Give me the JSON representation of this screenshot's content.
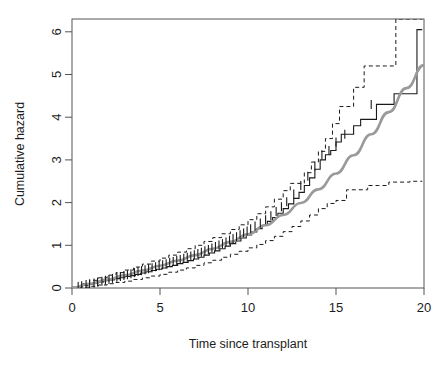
{
  "page": {
    "running_head": "DINATA: FOR THE RE-TRANSPLANT",
    "page_number": "9"
  },
  "figure": {
    "y_axis_title": "Cumulative hazard",
    "x_axis_title": "Time since transplant"
  },
  "chart_data": {
    "type": "line",
    "title": "",
    "xlabel": "Time since transplant",
    "ylabel": "Cumulative hazard",
    "xlim": [
      0,
      20
    ],
    "ylim": [
      0,
      6.3
    ],
    "xticks": [
      0,
      5,
      10,
      15,
      20
    ],
    "yticks": [
      0,
      1,
      2,
      3,
      4,
      5,
      6
    ],
    "grid": false,
    "legend": "none",
    "box": true,
    "annotations": [
      "Solid black step curve: Nelson-Aalen cumulative hazard estimate",
      "Dashed black step curves: pointwise confidence limits",
      "Smooth grey curve: fitted parametric cumulative hazard",
      "Short vertical ticks on the step curve mark censored observations"
    ],
    "series": [
      {
        "name": "Nelson-Aalen estimate",
        "style": "step",
        "color": "#1a1a1a",
        "dash": "solid",
        "width": 1.1,
        "x": [
          0.0,
          0.3,
          0.6,
          0.9,
          1.2,
          1.5,
          1.8,
          2.1,
          2.4,
          2.7,
          3.0,
          3.3,
          3.6,
          3.9,
          4.2,
          4.5,
          4.8,
          5.1,
          5.4,
          5.7,
          6.0,
          6.3,
          6.6,
          6.9,
          7.2,
          7.5,
          7.8,
          8.1,
          8.4,
          8.7,
          9.0,
          9.3,
          9.6,
          9.9,
          10.2,
          10.5,
          10.8,
          11.1,
          11.4,
          11.7,
          12.0,
          12.3,
          12.6,
          12.9,
          13.2,
          13.5,
          13.8,
          14.1,
          14.4,
          14.7,
          15.0,
          15.3,
          15.6,
          16.0,
          16.4,
          16.8,
          17.3,
          17.8,
          18.3,
          18.7,
          19.2,
          19.6,
          19.9
        ],
        "y": [
          0.0,
          0.03,
          0.06,
          0.09,
          0.12,
          0.14,
          0.17,
          0.19,
          0.22,
          0.24,
          0.27,
          0.29,
          0.32,
          0.35,
          0.38,
          0.41,
          0.44,
          0.47,
          0.5,
          0.53,
          0.57,
          0.6,
          0.64,
          0.68,
          0.72,
          0.77,
          0.82,
          0.87,
          0.92,
          0.98,
          1.04,
          1.1,
          1.17,
          1.24,
          1.31,
          1.39,
          1.47,
          1.56,
          1.65,
          1.75,
          1.86,
          1.97,
          2.1,
          2.24,
          2.4,
          2.58,
          2.78,
          3.0,
          3.12,
          3.22,
          3.42,
          3.6,
          3.6,
          3.8,
          3.95,
          3.95,
          4.3,
          4.3,
          4.55,
          4.55,
          4.55,
          6.05,
          6.05
        ]
      },
      {
        "name": "Upper confidence limit",
        "style": "step",
        "color": "#1a1a1a",
        "dash": "dashed",
        "width": 1.0,
        "x": [
          0.0,
          0.5,
          1.0,
          1.5,
          2.0,
          2.5,
          3.0,
          3.5,
          4.0,
          4.5,
          5.0,
          5.5,
          6.0,
          6.5,
          7.0,
          7.5,
          8.0,
          8.5,
          9.0,
          9.5,
          10.0,
          10.5,
          11.0,
          11.5,
          12.0,
          12.4,
          12.8,
          13.2,
          13.6,
          14.0,
          14.4,
          14.8,
          15.2,
          15.6,
          16.0,
          16.6,
          17.2,
          17.8,
          18.4,
          19.0,
          19.4,
          19.9
        ],
        "y": [
          0.02,
          0.1,
          0.18,
          0.24,
          0.3,
          0.36,
          0.42,
          0.49,
          0.56,
          0.63,
          0.7,
          0.77,
          0.84,
          0.92,
          1.0,
          1.09,
          1.18,
          1.27,
          1.37,
          1.48,
          1.6,
          1.74,
          1.9,
          2.08,
          2.28,
          2.45,
          2.45,
          2.7,
          2.95,
          3.2,
          3.5,
          3.85,
          4.25,
          4.25,
          4.7,
          5.2,
          5.2,
          5.2,
          6.3,
          6.3,
          6.3,
          6.3
        ]
      },
      {
        "name": "Lower confidence limit",
        "style": "step",
        "color": "#1a1a1a",
        "dash": "dashed",
        "width": 1.0,
        "x": [
          0.0,
          0.5,
          1.0,
          1.5,
          2.0,
          2.5,
          3.0,
          3.5,
          4.0,
          4.5,
          5.0,
          5.5,
          6.0,
          6.5,
          7.0,
          7.5,
          8.0,
          8.5,
          9.0,
          9.5,
          10.0,
          10.5,
          11.0,
          11.5,
          12.0,
          12.5,
          13.0,
          13.5,
          14.0,
          14.5,
          15.0,
          15.6,
          16.2,
          16.8,
          17.4,
          18.0,
          18.6,
          19.2,
          19.9
        ],
        "y": [
          0.0,
          0.02,
          0.04,
          0.07,
          0.1,
          0.13,
          0.16,
          0.2,
          0.24,
          0.28,
          0.32,
          0.37,
          0.42,
          0.47,
          0.53,
          0.59,
          0.65,
          0.72,
          0.79,
          0.86,
          0.94,
          1.02,
          1.11,
          1.21,
          1.32,
          1.44,
          1.57,
          1.71,
          1.86,
          1.98,
          2.05,
          2.3,
          2.3,
          2.4,
          2.4,
          2.48,
          2.48,
          2.5,
          2.5
        ]
      },
      {
        "name": "Fitted parametric hazard",
        "style": "smooth",
        "color": "#9a9a9a",
        "dash": "solid",
        "width": 2.6,
        "x": [
          0.0,
          1.0,
          2.0,
          3.0,
          4.0,
          5.0,
          6.0,
          7.0,
          8.0,
          9.0,
          10.0,
          11.0,
          12.0,
          13.0,
          14.0,
          15.0,
          16.0,
          17.0,
          18.0,
          19.0,
          20.0
        ],
        "y": [
          0.0,
          0.1,
          0.2,
          0.3,
          0.41,
          0.52,
          0.64,
          0.77,
          0.92,
          1.08,
          1.26,
          1.47,
          1.71,
          1.99,
          2.31,
          2.68,
          3.11,
          3.6,
          4.12,
          4.68,
          5.22
        ]
      }
    ],
    "censor_marks": {
      "name": "Censoring tick marks",
      "color": "#1a1a1a",
      "x": [
        0.35,
        0.55,
        0.8,
        1.0,
        1.25,
        1.45,
        1.7,
        1.9,
        2.1,
        2.3,
        2.55,
        2.75,
        2.95,
        3.15,
        3.35,
        3.55,
        3.75,
        3.95,
        4.15,
        4.35,
        4.55,
        4.75,
        4.95,
        5.15,
        5.35,
        5.55,
        5.75,
        5.95,
        6.15,
        6.35,
        6.55,
        6.75,
        6.95,
        7.15,
        7.35,
        7.55,
        7.75,
        7.95,
        8.15,
        8.35,
        8.55,
        8.75,
        8.95,
        9.15,
        9.35,
        9.55,
        9.75,
        9.95,
        10.15,
        10.4,
        10.7,
        11.0,
        11.3,
        11.6,
        11.9,
        12.2,
        12.6,
        13.0,
        13.4,
        13.8,
        14.2,
        14.6,
        15.0,
        15.5,
        17.0
      ],
      "y": [
        0.035,
        0.055,
        0.08,
        0.1,
        0.12,
        0.14,
        0.16,
        0.18,
        0.205,
        0.225,
        0.25,
        0.27,
        0.29,
        0.31,
        0.335,
        0.36,
        0.385,
        0.405,
        0.425,
        0.45,
        0.475,
        0.5,
        0.52,
        0.545,
        0.57,
        0.595,
        0.62,
        0.645,
        0.67,
        0.695,
        0.72,
        0.75,
        0.78,
        0.81,
        0.84,
        0.87,
        0.9,
        0.935,
        0.97,
        1.005,
        1.04,
        1.08,
        1.12,
        1.16,
        1.2,
        1.245,
        1.29,
        1.335,
        1.385,
        1.45,
        1.52,
        1.6,
        1.69,
        1.79,
        1.9,
        2.02,
        2.2,
        2.4,
        2.62,
        2.86,
        3.12,
        3.22,
        3.42,
        3.6,
        4.3
      ]
    }
  }
}
